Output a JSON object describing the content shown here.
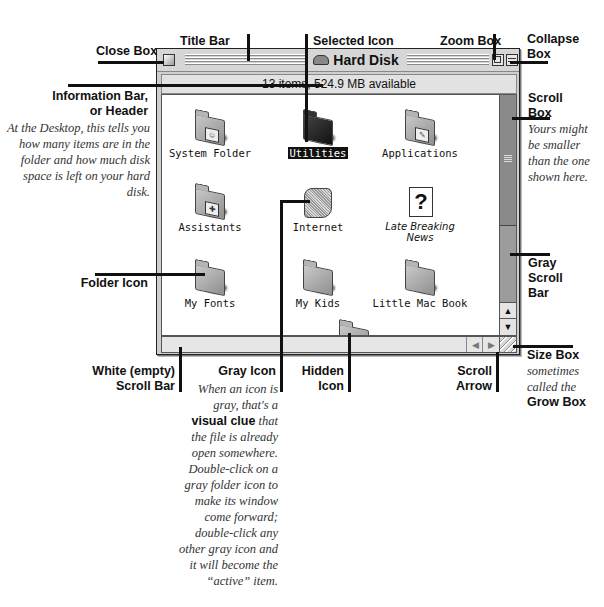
{
  "window": {
    "title": "Hard Disk",
    "info_bar": "13 items, 524.9 MB available",
    "icons": [
      {
        "name": "System Folder",
        "kind": "folder",
        "badge": "system",
        "state": "normal"
      },
      {
        "name": "Utilities",
        "kind": "folder",
        "badge": "tools",
        "state": "selected"
      },
      {
        "name": "Applications",
        "kind": "folder",
        "badge": "apps",
        "state": "normal"
      },
      {
        "name": "Assistants",
        "kind": "folder",
        "badge": "assistant",
        "state": "normal"
      },
      {
        "name": "Internet",
        "kind": "folder",
        "badge": "",
        "state": "gray"
      },
      {
        "name": "Late Breaking News",
        "kind": "document",
        "badge": "?",
        "state": "alias"
      },
      {
        "name": "My Fonts",
        "kind": "folder",
        "badge": "",
        "state": "normal"
      },
      {
        "name": "My Kids",
        "kind": "folder",
        "badge": "",
        "state": "normal"
      },
      {
        "name": "Little Mac Book",
        "kind": "folder",
        "badge": "",
        "state": "normal"
      },
      {
        "name": "",
        "kind": "folder",
        "badge": "",
        "state": "hidden"
      }
    ],
    "scroll": {
      "up": "▲",
      "down": "▼",
      "left": "◀",
      "right": "▶",
      "grip": "≡"
    }
  },
  "callouts": {
    "close_box": "Close Box",
    "title_bar": "Title Bar",
    "selected_icon": "Selected Icon",
    "zoom_box": "Zoom Box",
    "collapse_box_1": "Collapse",
    "collapse_box_2": "Box",
    "info_bar_1": "Information Bar,",
    "info_bar_2": "or Header",
    "info_bar_note": "At the Desktop, this tells you how many items are in the folder and how much disk space is left on your hard disk.",
    "scroll_box_1": "Scroll",
    "scroll_box_2": "Box",
    "scroll_box_note": "Yours might be smaller than the one shown here.",
    "gray_scroll_bar": [
      "Gray",
      "Scroll",
      "Bar"
    ],
    "folder_icon": "Folder Icon",
    "size_box": "Size Box",
    "size_box_note": "sometimes called the",
    "grow_box": "Grow Box",
    "white_scroll_bar_1": "White (empty)",
    "white_scroll_bar_2": "Scroll Bar",
    "gray_icon": "Gray Icon",
    "gray_icon_note_1": "When an icon is gray, that's a",
    "gray_icon_note_bold": "visual clue",
    "gray_icon_note_2": "that the file is already open somewhere. Double-click on a gray folder icon to make its window come forward; double-click any other gray icon and it will become the “active” item.",
    "hidden_icon_1": "Hidden",
    "hidden_icon_2": "Icon",
    "scroll_arrow_1": "Scroll",
    "scroll_arrow_2": "Arrow"
  }
}
